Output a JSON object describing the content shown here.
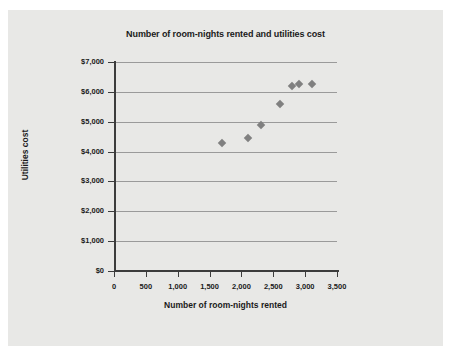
{
  "chart_data": {
    "type": "scatter",
    "title": "Number of room-nights rented and utilities cost",
    "xlabel": "Number of room-nights rented",
    "ylabel": "Utilities cost",
    "xlim": [
      0,
      3500
    ],
    "ylim": [
      0,
      7000
    ],
    "grid": true,
    "legend": "none",
    "marker_color": "#808080",
    "marker_shape": "diamond",
    "xticks": [
      0,
      500,
      1000,
      1500,
      2000,
      2500,
      3000,
      3500
    ],
    "xtick_labels": [
      "0",
      "500",
      "1,000",
      "1,500",
      "2,000",
      "2,500",
      "3,000",
      "3,500"
    ],
    "yticks": [
      0,
      1000,
      2000,
      3000,
      4000,
      5000,
      6000,
      7000
    ],
    "ytick_labels": [
      "$0",
      "$1,000",
      "$2,000",
      "$3,000",
      "$4,000",
      "$5,000",
      "$6,000",
      "$7,000"
    ],
    "points": [
      {
        "x": 1700,
        "y": 4280
      },
      {
        "x": 2100,
        "y": 4460
      },
      {
        "x": 2300,
        "y": 4880
      },
      {
        "x": 2600,
        "y": 5580
      },
      {
        "x": 2800,
        "y": 6190
      },
      {
        "x": 2900,
        "y": 6260
      },
      {
        "x": 3100,
        "y": 6250
      }
    ]
  }
}
